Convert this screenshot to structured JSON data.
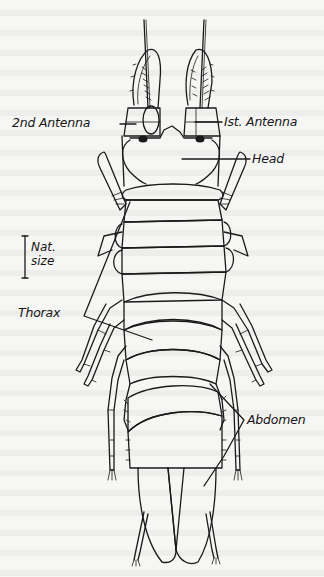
{
  "figure": {
    "colors": {
      "ink": "#1a1a1a",
      "paper": "#f6f6f4"
    }
  },
  "labels": {
    "second_antenna": "2nd Antenna",
    "first_antenna": "Ist. Antenna",
    "head": "Head",
    "thorax": "Thorax",
    "abdomen": "Abdomen"
  },
  "scale_bar": {
    "line1": "Nat.",
    "line2": "size"
  }
}
